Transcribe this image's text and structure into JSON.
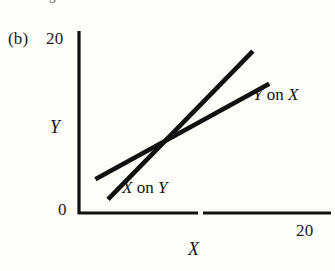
{
  "figure": {
    "panel_label": "(b)",
    "cutoff_text_above": "regression lines",
    "background_color": "#fdfdf9",
    "ink_color": "#111111"
  },
  "axes": {
    "y_title": "Y",
    "x_title": "X",
    "y_tick_top": "20",
    "y_tick_bottom": "0",
    "x_tick_right": "20"
  },
  "labels": {
    "y_on_x": {
      "var1": "Y",
      "conj": "on",
      "var2": "X"
    },
    "x_on_y": {
      "var1": "X",
      "conj": "on",
      "var2": "Y"
    }
  },
  "chart_data": {
    "type": "line",
    "title": "(b)",
    "xlabel": "X",
    "ylabel": "Y",
    "xlim": [
      0,
      20
    ],
    "ylim": [
      0,
      20
    ],
    "grid": false,
    "legend": "inline-annotations",
    "xticks": [
      0,
      20
    ],
    "yticks": [
      0,
      20
    ],
    "series": [
      {
        "name": "Y on X",
        "annotation": "Y on X",
        "x": [
          1.3,
          15.1
        ],
        "y": [
          3.7,
          14.2
        ],
        "slope": 0.76,
        "style": "solid-thick",
        "color": "#111111"
      },
      {
        "name": "X on Y",
        "annotation": "X on Y",
        "x": [
          2.3,
          13.8
        ],
        "y": [
          1.5,
          17.8
        ],
        "slope": 1.42,
        "style": "solid-thick",
        "color": "#111111"
      }
    ],
    "intersection": {
      "x": 6.1,
      "y": 8.0
    }
  }
}
